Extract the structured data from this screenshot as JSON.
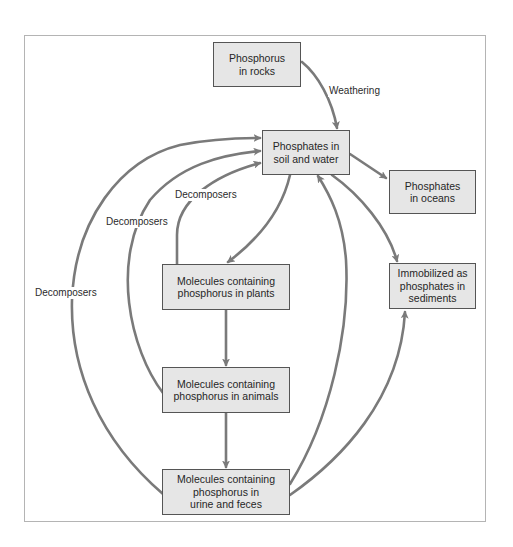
{
  "diagram": {
    "colors": {
      "box_fill": "#e6e6e6",
      "box_border": "#555555",
      "arrow": "#7a7a7a",
      "frame": "#b4b4b4",
      "text": "#262626"
    },
    "nodes": {
      "rocks": "Phosphorus\nin rocks",
      "soil": "Phosphates in\nsoil and water",
      "oceans": "Phosphates\nin oceans",
      "sediments": "Immobilized as\nphosphates in\nsediments",
      "plants": "Molecules containing\nphosphorus in plants",
      "animals": "Molecules containing\nphosphorus in animals",
      "urine": "Molecules containing\nphosphorus in\nurine and feces"
    },
    "labels": {
      "weathering": "Weathering",
      "decomposers_plants": "Decomposers",
      "decomposers_animals": "Decomposers",
      "decomposers_urine": "Decomposers"
    },
    "edges": [
      {
        "from": "rocks",
        "to": "soil",
        "label": "Weathering"
      },
      {
        "from": "soil",
        "to": "oceans",
        "label": ""
      },
      {
        "from": "soil",
        "to": "sediments",
        "label": ""
      },
      {
        "from": "soil",
        "to": "plants",
        "label": ""
      },
      {
        "from": "plants",
        "to": "animals",
        "label": ""
      },
      {
        "from": "animals",
        "to": "urine",
        "label": ""
      },
      {
        "from": "plants",
        "to": "soil",
        "label": "Decomposers"
      },
      {
        "from": "animals",
        "to": "soil",
        "label": "Decomposers"
      },
      {
        "from": "urine",
        "to": "soil",
        "label": "Decomposers"
      },
      {
        "from": "urine",
        "to": "soil",
        "label": ""
      },
      {
        "from": "urine",
        "to": "sediments",
        "label": ""
      }
    ]
  }
}
